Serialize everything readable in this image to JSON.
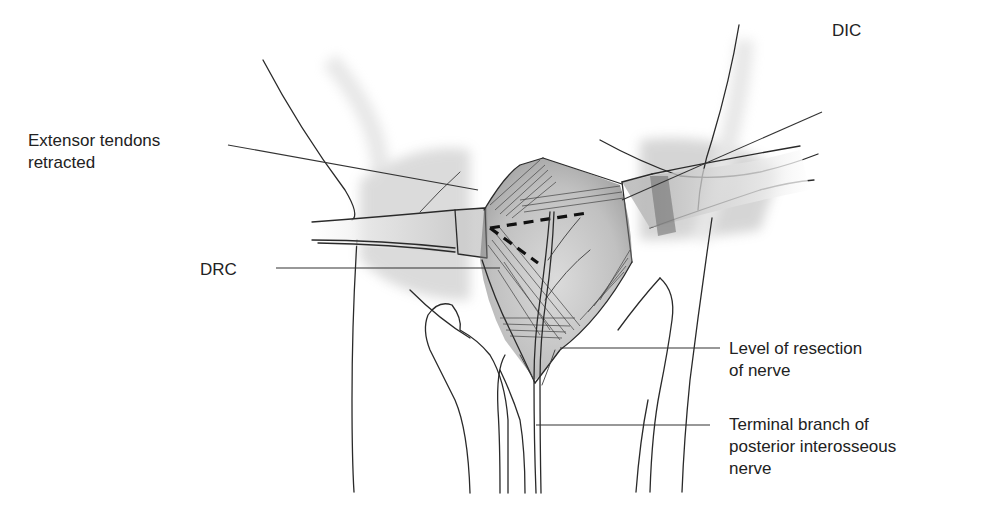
{
  "figure": {
    "type": "anatomical-illustration",
    "colors": {
      "ink": "#222222",
      "shade": "#9a9a9a",
      "background": "#ffffff"
    }
  },
  "labels": [
    {
      "id": "extensor",
      "text": "Extensor tendons\nretracted",
      "x": 28,
      "y": 130
    },
    {
      "id": "dic",
      "text": "DIC",
      "x": 832,
      "y": 20
    },
    {
      "id": "drc",
      "text": "DRC",
      "x": 200,
      "y": 259
    },
    {
      "id": "resection",
      "text": "Level of resection\nof nerve",
      "x": 729,
      "y": 317
    },
    {
      "id": "terminal",
      "text": "Terminal branch of\nposterior interosseous\nnerve",
      "x": 729,
      "y": 414
    }
  ],
  "leaders": [
    {
      "id": "extensor",
      "from": [
        228,
        145
      ],
      "to": [
        478,
        190
      ]
    },
    {
      "id": "dic",
      "from": [
        822,
        112
      ],
      "to": [
        622,
        200
      ]
    },
    {
      "id": "drc",
      "from": [
        276,
        268
      ],
      "to": [
        500,
        268
      ]
    },
    {
      "id": "resection",
      "from": [
        720,
        348
      ],
      "to": [
        560,
        348
      ]
    },
    {
      "id": "terminal",
      "from": [
        710,
        425
      ],
      "to": [
        536,
        425
      ]
    }
  ]
}
